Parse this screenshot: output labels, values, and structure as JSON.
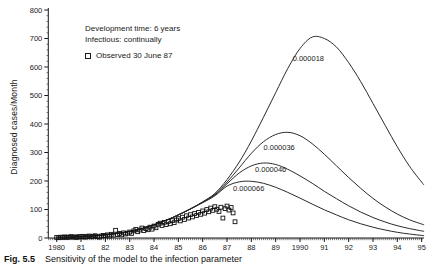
{
  "figure": {
    "caption_fig": "Fig. 5.5",
    "caption_text": "Sensitivity of the model to the infection parameter"
  },
  "legend": {
    "line1": "Development time: 6 years",
    "line2": "Infectious: continually",
    "observed_label": "Observed 30 June 87",
    "marker": "open-square"
  },
  "colors": {
    "ink": "#1a1a1a",
    "curve": "#2a2a2a",
    "background": "#ffffff"
  },
  "chart_data": {
    "type": "line",
    "title": "",
    "xlabel": "",
    "ylabel": "Diagnosed cases/Month",
    "xlim": [
      1979.65,
      1995.1
    ],
    "ylim": [
      0,
      800
    ],
    "grid": false,
    "legend_position": "upper-left-inside",
    "x_axis": {
      "tick_years": [
        1980,
        1981,
        1982,
        1983,
        1984,
        1985,
        1986,
        1987,
        1988,
        1989,
        1990,
        1991,
        1992,
        1993,
        1994,
        1995
      ],
      "tick_labels": [
        "1980",
        "81",
        "82",
        "83",
        "84",
        "85",
        "86",
        "87",
        "88",
        "89",
        "1990",
        "91",
        "92",
        "93",
        "94",
        "95"
      ],
      "minor_tick_interval_years": 0.08333
    },
    "y_axis": {
      "ticks": [
        0,
        100,
        200,
        300,
        400,
        500,
        600,
        700,
        800
      ],
      "tick_labels": [
        "0",
        "100",
        "200",
        "300",
        "400",
        "500",
        "600",
        "700",
        "800"
      ],
      "minor_tick_interval": 20
    },
    "series": [
      {
        "label": "0.000018",
        "label_anchor": {
          "x": 1989.7,
          "y": 631
        },
        "points": [
          [
            1980,
            2
          ],
          [
            1980.5,
            3
          ],
          [
            1981,
            5
          ],
          [
            1981.5,
            7
          ],
          [
            1982,
            11
          ],
          [
            1982.5,
            16
          ],
          [
            1983,
            23
          ],
          [
            1983.5,
            33
          ],
          [
            1984,
            46
          ],
          [
            1984.5,
            62
          ],
          [
            1985,
            81
          ],
          [
            1985.5,
            102
          ],
          [
            1986,
            127
          ],
          [
            1986.5,
            156
          ],
          [
            1987,
            205
          ],
          [
            1987.5,
            266
          ],
          [
            1988,
            340
          ],
          [
            1988.5,
            424
          ],
          [
            1989,
            510
          ],
          [
            1989.5,
            595
          ],
          [
            1990,
            665
          ],
          [
            1990.5,
            705
          ],
          [
            1991,
            700
          ],
          [
            1991.5,
            670
          ],
          [
            1992,
            615
          ],
          [
            1992.5,
            548
          ],
          [
            1993,
            472
          ],
          [
            1993.5,
            395
          ],
          [
            1994,
            320
          ],
          [
            1994.5,
            252
          ],
          [
            1995,
            196
          ],
          [
            1995.1,
            186
          ]
        ]
      },
      {
        "label": "0.000036",
        "label_anchor": {
          "x": 1988.5,
          "y": 319
        },
        "points": [
          [
            1980,
            2
          ],
          [
            1980.5,
            3
          ],
          [
            1981,
            5
          ],
          [
            1981.5,
            7
          ],
          [
            1982,
            11
          ],
          [
            1982.5,
            16
          ],
          [
            1983,
            23
          ],
          [
            1983.5,
            33
          ],
          [
            1984,
            46
          ],
          [
            1984.5,
            62
          ],
          [
            1985,
            81
          ],
          [
            1985.5,
            102
          ],
          [
            1986,
            126
          ],
          [
            1986.5,
            153
          ],
          [
            1987,
            196
          ],
          [
            1987.5,
            246
          ],
          [
            1988,
            297
          ],
          [
            1988.5,
            338
          ],
          [
            1989,
            363
          ],
          [
            1989.5,
            371
          ],
          [
            1990,
            359
          ],
          [
            1990.5,
            331
          ],
          [
            1991,
            294
          ],
          [
            1991.5,
            253
          ],
          [
            1992,
            212
          ],
          [
            1992.5,
            174
          ],
          [
            1993,
            139
          ],
          [
            1993.5,
            109
          ],
          [
            1994,
            84
          ],
          [
            1994.5,
            64
          ],
          [
            1995,
            49
          ],
          [
            1995.1,
            46
          ]
        ]
      },
      {
        "label": "0.000046",
        "label_anchor": {
          "x": 1988.15,
          "y": 240
        },
        "points": [
          [
            1980,
            2
          ],
          [
            1980.5,
            3
          ],
          [
            1981,
            5
          ],
          [
            1981.5,
            7
          ],
          [
            1982,
            11
          ],
          [
            1982.5,
            16
          ],
          [
            1983,
            23
          ],
          [
            1983.5,
            33
          ],
          [
            1984,
            46
          ],
          [
            1984.5,
            62
          ],
          [
            1985,
            81
          ],
          [
            1985.5,
            102
          ],
          [
            1986,
            125
          ],
          [
            1986.5,
            151
          ],
          [
            1987,
            190
          ],
          [
            1987.5,
            228
          ],
          [
            1988,
            253
          ],
          [
            1988.5,
            263
          ],
          [
            1989,
            258
          ],
          [
            1989.5,
            241
          ],
          [
            1990,
            218
          ],
          [
            1990.5,
            192
          ],
          [
            1991,
            164
          ],
          [
            1991.5,
            138
          ],
          [
            1992,
            113
          ],
          [
            1992.5,
            91
          ],
          [
            1993,
            72
          ],
          [
            1993.5,
            56
          ],
          [
            1994,
            43
          ],
          [
            1994.5,
            33
          ],
          [
            1995,
            25
          ],
          [
            1995.1,
            23
          ]
        ]
      },
      {
        "label": "0.000066",
        "label_anchor": {
          "x": 1987.25,
          "y": 175
        },
        "points": [
          [
            1980,
            2
          ],
          [
            1980.5,
            3
          ],
          [
            1981,
            5
          ],
          [
            1981.5,
            7
          ],
          [
            1982,
            11
          ],
          [
            1982.5,
            16
          ],
          [
            1983,
            23
          ],
          [
            1983.5,
            33
          ],
          [
            1984,
            46
          ],
          [
            1984.5,
            62
          ],
          [
            1985,
            81
          ],
          [
            1985.5,
            102
          ],
          [
            1986,
            124
          ],
          [
            1986.5,
            148
          ],
          [
            1987,
            182
          ],
          [
            1987.5,
            197
          ],
          [
            1988,
            199
          ],
          [
            1988.5,
            192
          ],
          [
            1989,
            178
          ],
          [
            1989.5,
            160
          ],
          [
            1990,
            140
          ],
          [
            1990.5,
            119
          ],
          [
            1991,
            99
          ],
          [
            1991.5,
            81
          ],
          [
            1992,
            64
          ],
          [
            1992.5,
            50
          ],
          [
            1993,
            38
          ],
          [
            1993.5,
            28
          ],
          [
            1994,
            20
          ],
          [
            1994.5,
            14
          ],
          [
            1995,
            9
          ],
          [
            1995.1,
            8
          ]
        ]
      }
    ],
    "observed": {
      "label": "Observed 30 June 87",
      "marker": "open-square",
      "points": [
        [
          1980.0,
          2
        ],
        [
          1980.08,
          1
        ],
        [
          1980.17,
          3
        ],
        [
          1980.25,
          2
        ],
        [
          1980.33,
          4
        ],
        [
          1980.42,
          2
        ],
        [
          1980.5,
          3
        ],
        [
          1980.58,
          5
        ],
        [
          1980.67,
          3
        ],
        [
          1980.75,
          4
        ],
        [
          1980.83,
          2
        ],
        [
          1980.92,
          5
        ],
        [
          1981.0,
          4
        ],
        [
          1981.08,
          6
        ],
        [
          1981.17,
          3
        ],
        [
          1981.25,
          5
        ],
        [
          1981.33,
          7
        ],
        [
          1981.42,
          4
        ],
        [
          1981.5,
          6
        ],
        [
          1981.58,
          8
        ],
        [
          1981.67,
          5
        ],
        [
          1981.75,
          3
        ],
        [
          1981.83,
          7
        ],
        [
          1981.92,
          9
        ],
        [
          1982.0,
          8
        ],
        [
          1982.08,
          11
        ],
        [
          1982.17,
          7
        ],
        [
          1982.25,
          13
        ],
        [
          1982.33,
          10
        ],
        [
          1982.42,
          27
        ],
        [
          1982.5,
          12
        ],
        [
          1982.58,
          16
        ],
        [
          1982.67,
          11
        ],
        [
          1982.75,
          18
        ],
        [
          1982.83,
          14
        ],
        [
          1982.92,
          17
        ],
        [
          1983.0,
          21
        ],
        [
          1983.08,
          16
        ],
        [
          1983.17,
          25
        ],
        [
          1983.25,
          30
        ],
        [
          1983.33,
          22
        ],
        [
          1983.42,
          28
        ],
        [
          1983.5,
          35
        ],
        [
          1983.58,
          26
        ],
        [
          1983.67,
          33
        ],
        [
          1983.75,
          29
        ],
        [
          1983.83,
          38
        ],
        [
          1983.92,
          31
        ],
        [
          1984.0,
          42
        ],
        [
          1984.08,
          36
        ],
        [
          1984.17,
          48
        ],
        [
          1984.25,
          52
        ],
        [
          1984.33,
          44
        ],
        [
          1984.42,
          55
        ],
        [
          1984.5,
          47
        ],
        [
          1984.58,
          58
        ],
        [
          1984.67,
          50
        ],
        [
          1984.75,
          61
        ],
        [
          1984.83,
          54
        ],
        [
          1984.92,
          63
        ],
        [
          1985.0,
          68
        ],
        [
          1985.08,
          60
        ],
        [
          1985.17,
          73
        ],
        [
          1985.25,
          65
        ],
        [
          1985.33,
          78
        ],
        [
          1985.42,
          70
        ],
        [
          1985.5,
          82
        ],
        [
          1985.58,
          74
        ],
        [
          1985.67,
          86
        ],
        [
          1985.75,
          79
        ],
        [
          1985.83,
          90
        ],
        [
          1985.92,
          83
        ],
        [
          1986.0,
          95
        ],
        [
          1986.08,
          87
        ],
        [
          1986.17,
          100
        ],
        [
          1986.25,
          92
        ],
        [
          1986.33,
          105
        ],
        [
          1986.42,
          97
        ],
        [
          1986.5,
          110
        ],
        [
          1986.58,
          101
        ],
        [
          1986.67,
          93
        ],
        [
          1986.75,
          108
        ],
        [
          1986.83,
          70
        ],
        [
          1986.92,
          103
        ],
        [
          1987.0,
          112
        ],
        [
          1987.08,
          98
        ],
        [
          1987.17,
          107
        ],
        [
          1987.25,
          88
        ],
        [
          1987.33,
          57
        ]
      ]
    }
  }
}
